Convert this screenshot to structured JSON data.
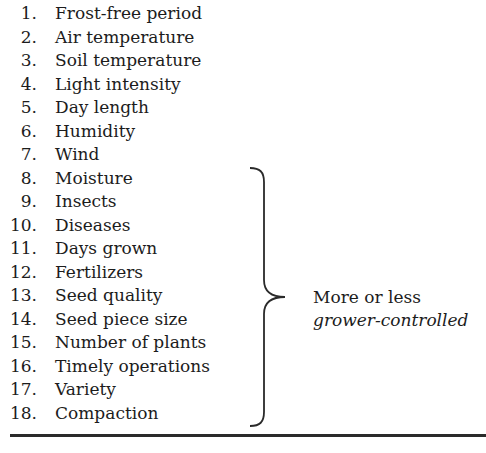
{
  "factors": [
    {
      "num": "1.",
      "label": "Frost-free period"
    },
    {
      "num": "2.",
      "label": "Air temperature"
    },
    {
      "num": "3.",
      "label": "Soil temperature"
    },
    {
      "num": "4.",
      "label": "Light intensity"
    },
    {
      "num": "5.",
      "label": "Day length"
    },
    {
      "num": "6.",
      "label": "Humidity"
    },
    {
      "num": "7.",
      "label": "Wind"
    },
    {
      "num": "8.",
      "label": "Moisture"
    },
    {
      "num": "9.",
      "label": "Insects"
    },
    {
      "num": "10.",
      "label": "Diseases"
    },
    {
      "num": "11.",
      "label": "Days grown"
    },
    {
      "num": "12.",
      "label": "Fertilizers"
    },
    {
      "num": "13.",
      "label": "Seed quality"
    },
    {
      "num": "14.",
      "label": "Seed piece size"
    },
    {
      "num": "15.",
      "label": "Number of plants"
    },
    {
      "num": "16.",
      "label": "Timely operations"
    },
    {
      "num": "17.",
      "label": "Variety"
    },
    {
      "num": "18.",
      "label": "Compaction"
    }
  ],
  "bracket_note": {
    "line1": "More or less",
    "line2": "grower-controlled",
    "applies_to_items": "8–18"
  }
}
